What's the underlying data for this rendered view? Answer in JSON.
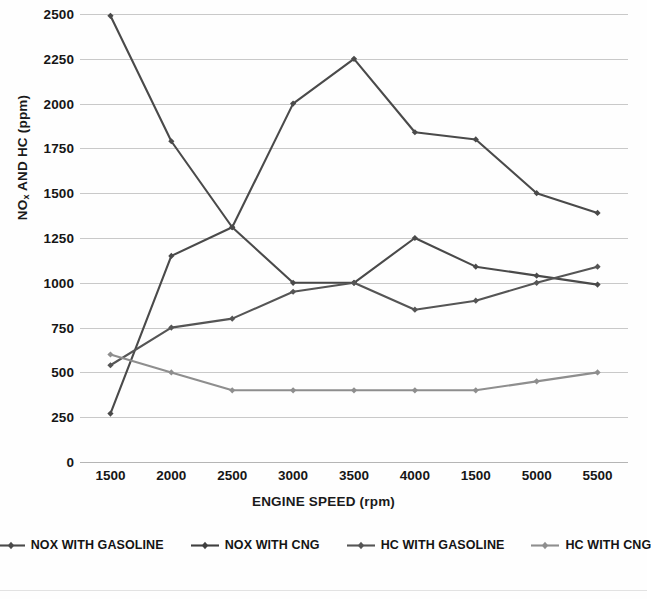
{
  "chart_data": {
    "type": "line",
    "title": "",
    "xlabel": "ENGINE SPEED (rpm)",
    "ylabel": "NOx AND HC (ppm)",
    "ylabel_rich": {
      "main_a": "NO",
      "sub": "x",
      "main_b": " AND HC (ppm)"
    },
    "categories": [
      "1500",
      "2000",
      "2500",
      "3000",
      "3500",
      "4000",
      "1500",
      "5000",
      "5500"
    ],
    "x_tick_labels": [
      "1500",
      "2000",
      "2500",
      "3000",
      "3500",
      "4000",
      "1500",
      "5000",
      "5500"
    ],
    "y_tick_labels": [
      "0",
      "250",
      "500",
      "750",
      "1000",
      "1250",
      "1500",
      "1750",
      "2000",
      "2250",
      "2500"
    ],
    "y_ticks": [
      0,
      250,
      500,
      750,
      1000,
      1250,
      1500,
      1750,
      2000,
      2250,
      2500
    ],
    "ylim": [
      0,
      2500
    ],
    "grid": true,
    "grid_axis": "y",
    "legend_position": "bottom",
    "series": [
      {
        "name": "NOX WITH GASOLINE",
        "color": "#4a4a4a",
        "marker": "diamond",
        "values": [
          2490,
          1790,
          1310,
          1000,
          1000,
          1250,
          1090,
          1040,
          990
        ]
      },
      {
        "name": "NOX WITH CNG",
        "color": "#4a4a4a",
        "marker": "diamond",
        "values": [
          270,
          1150,
          1310,
          2000,
          2250,
          1840,
          1800,
          1500,
          1390
        ]
      },
      {
        "name": "HC WITH GASOLINE",
        "color": "#555555",
        "marker": "diamond",
        "values": [
          540,
          750,
          800,
          950,
          1000,
          850,
          900,
          1000,
          1090
        ]
      },
      {
        "name": "HC WITH CNG",
        "color": "#8e8e8e",
        "marker": "diamond",
        "values": [
          600,
          500,
          400,
          400,
          400,
          400,
          400,
          450,
          500
        ]
      }
    ]
  },
  "legend": {
    "items": [
      {
        "label": "NOX WITH GASOLINE",
        "color": "#4a4a4a"
      },
      {
        "label": "NOX WITH CNG",
        "color": "#3f3f3f"
      },
      {
        "label": "HC WITH GASOLINE",
        "color": "#555555"
      },
      {
        "label": "HC WITH CNG",
        "color": "#8e8e8e"
      }
    ]
  }
}
